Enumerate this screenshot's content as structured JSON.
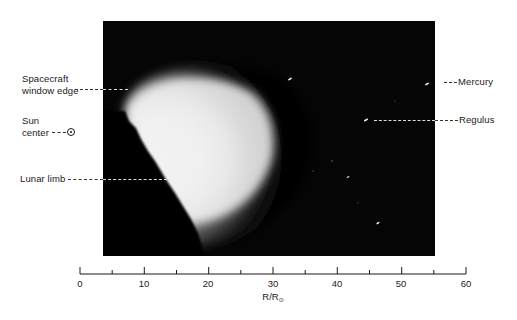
{
  "figure": {
    "labels": {
      "window_edge_line1": "Spacecraft",
      "window_edge_line2": "window edge",
      "sun_line1": "Sun",
      "sun_line2": "center",
      "lunar_limb": "Lunar limb",
      "mercury": "Mercury",
      "regulus": "Regulus"
    },
    "axis": {
      "title": "R/R",
      "title_subscript": "⊙",
      "min": 0,
      "max": 60,
      "major_ticks": [
        "0",
        "10",
        "20",
        "30",
        "40",
        "50",
        "60"
      ],
      "minor_tick_values": [
        5,
        15,
        25,
        35,
        45,
        55
      ]
    },
    "colors": {
      "photo_background": "#050505",
      "corona_peak": "#f4f4f4",
      "text": "#1a1a1a"
    }
  }
}
